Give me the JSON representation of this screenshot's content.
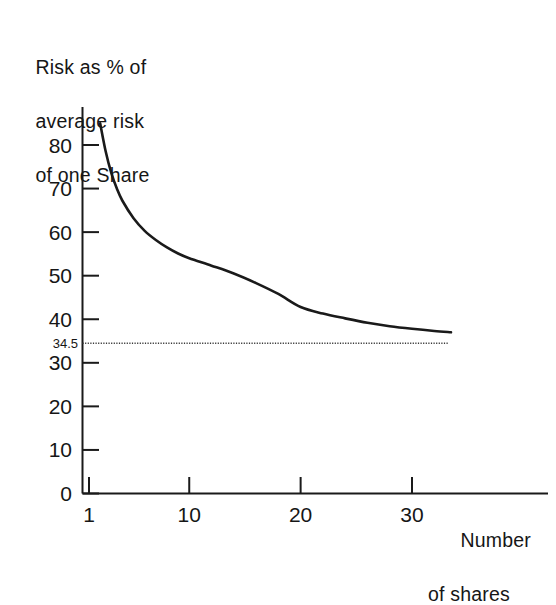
{
  "chart_data": {
    "type": "line",
    "title": "",
    "ylabel": "Risk as % of\naverage risk\nof one Share",
    "ylabel_lines": [
      "Risk as % of",
      "average risk",
      "of one Share"
    ],
    "xlabel": "Number\nof shares",
    "xlabel_lines": [
      "Number",
      "of shares"
    ],
    "xlim": [
      0,
      34
    ],
    "ylim": [
      0,
      88
    ],
    "grid": false,
    "legend": null,
    "yticks": [
      0,
      10,
      20,
      30,
      40,
      50,
      60,
      70,
      80
    ],
    "yticklabels": [
      "0",
      "10",
      "20",
      "30",
      "40",
      "50",
      "60",
      "70",
      "80"
    ],
    "xticks": [
      1,
      10,
      20,
      30
    ],
    "xticklabels": [
      "1",
      "10",
      "20",
      "30"
    ],
    "annotations": [
      {
        "name": "market-risk-asymptote",
        "label": "34.5",
        "value": 34.5,
        "style": "dotted-horizontal-line",
        "color": "#3a3a3a"
      }
    ],
    "series": [
      {
        "name": "portfolio-risk",
        "color": "#1a1a1a",
        "x": [
          2,
          2.5,
          3,
          3.5,
          4,
          5,
          6,
          7,
          8,
          9,
          10,
          12,
          14,
          16,
          18,
          20,
          22,
          24,
          26,
          28,
          30,
          32,
          33.5
        ],
        "values": [
          85.0,
          78.5,
          73.6,
          70.0,
          67.2,
          63.2,
          60.3,
          58.2,
          56.5,
          55.1,
          54.0,
          52.3,
          50.5,
          48.3,
          45.8,
          42.8,
          41.3,
          40.2,
          39.2,
          38.4,
          37.8,
          37.3,
          37.0
        ]
      }
    ]
  },
  "axis_labels": {
    "y_title_line1": "Risk as % of",
    "y_title_line2": "average risk",
    "y_title_line3": "of one Share",
    "x_title_line1": "Number",
    "x_title_line2": "of shares"
  },
  "colors": {
    "background": "#ffffff",
    "axis": "#1a1a1a",
    "curve": "#1a1a1a",
    "dotted_line": "#3a3a3a",
    "text": "#161616"
  }
}
